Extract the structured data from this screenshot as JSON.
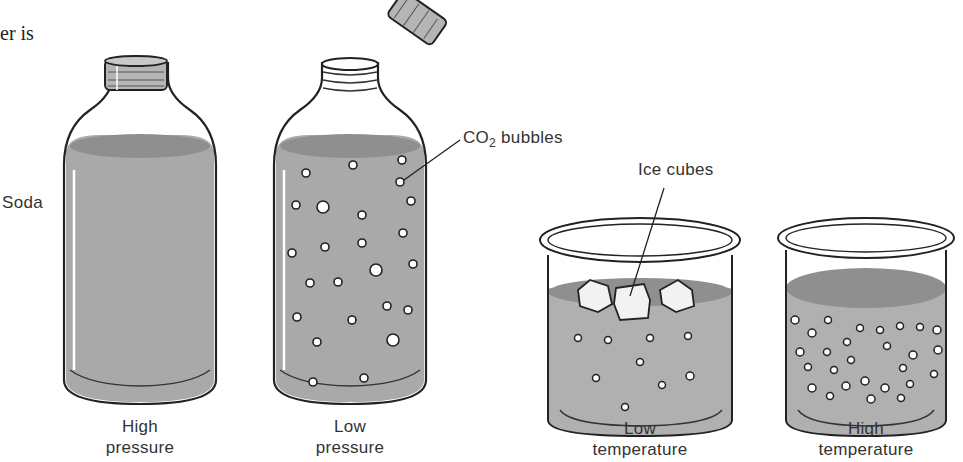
{
  "fragment_text": "er is",
  "labels": {
    "soda": "Soda",
    "co2": "CO",
    "co2_sub": "2",
    "co2_rest": " bubbles",
    "ice": "Ice cubes"
  },
  "captions": [
    {
      "line1": "High",
      "line2": "pressure"
    },
    {
      "line1": "Low",
      "line2": "pressure"
    },
    {
      "line1": "Low",
      "line2": "temperature"
    },
    {
      "line1": "High",
      "line2": "temperature"
    }
  ],
  "colors": {
    "liquid": "#a9a9a9",
    "liquid_top": "#8f8f8f",
    "outline": "#222222",
    "cap": "#b5b5b5",
    "bubble": "#ffffff"
  }
}
